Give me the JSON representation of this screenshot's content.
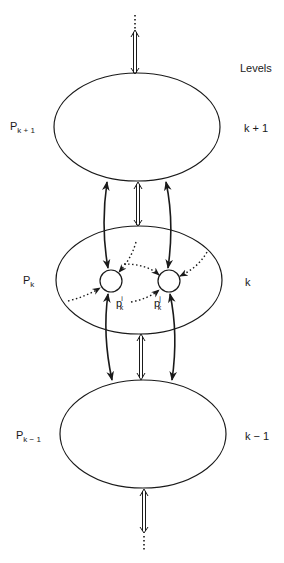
{
  "header": {
    "levels_label": "Levels"
  },
  "processes": [
    {
      "name": "P",
      "subscript": "k + 1",
      "level": "k + 1"
    },
    {
      "name": "P",
      "subscript": "k",
      "level": "k"
    },
    {
      "name": "P",
      "subscript": "k − 1",
      "level": "k − 1"
    }
  ],
  "subprocesses": [
    {
      "name": "p",
      "superscript": "i",
      "subscript": "k"
    },
    {
      "name": "p",
      "superscript": "j",
      "subscript": "k"
    }
  ],
  "colors": {
    "stroke": "#1a1a1a",
    "background": "#ffffff"
  }
}
